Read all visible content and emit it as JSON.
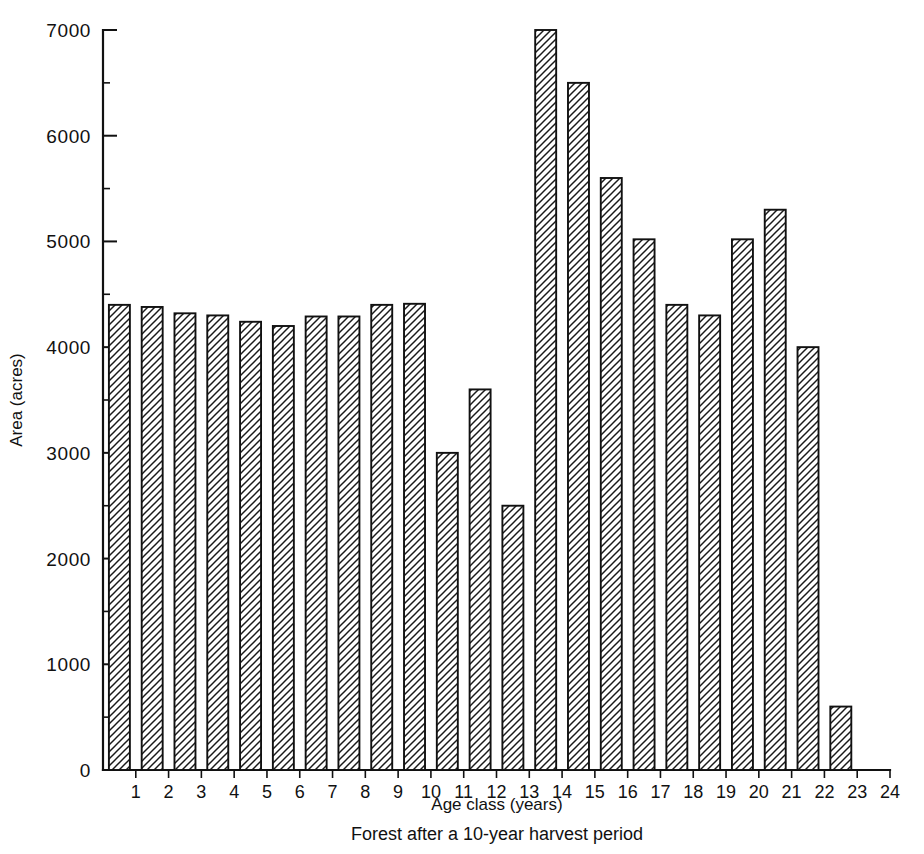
{
  "chart_data": {
    "type": "bar",
    "title": "",
    "subtitle": "",
    "xlabel": "Age class (years)",
    "ylabel": "Area (acres)",
    "caption": "Forest after a 10-year harvest period",
    "categories": [
      "1",
      "2",
      "3",
      "4",
      "5",
      "6",
      "7",
      "8",
      "9",
      "10",
      "11",
      "12",
      "13",
      "14",
      "15",
      "16",
      "17",
      "18",
      "19",
      "20",
      "21",
      "22",
      "23"
    ],
    "values": [
      4400,
      4380,
      4320,
      4300,
      4240,
      4200,
      4290,
      4290,
      4400,
      4410,
      3000,
      3600,
      2500,
      7000,
      6500,
      5600,
      5020,
      4400,
      4300,
      5020,
      5300,
      4000,
      600
    ],
    "ylim": [
      0,
      7000
    ],
    "xlim": [
      0,
      24
    ],
    "ytick_labels": [
      "0",
      "1000",
      "2000",
      "3000",
      "4000",
      "5000",
      "6000",
      "7000"
    ],
    "ytick_values": [
      0,
      1000,
      2000,
      3000,
      4000,
      5000,
      6000,
      7000
    ],
    "yminor_values": [
      500,
      1500,
      2500,
      3500,
      4500,
      5500,
      6500
    ],
    "xtick_labels": [
      "1",
      "2",
      "3",
      "4",
      "5",
      "6",
      "7",
      "8",
      "9",
      "10",
      "11",
      "12",
      "13",
      "14",
      "15",
      "16",
      "17",
      "18",
      "19",
      "20",
      "21",
      "22",
      "23",
      "24"
    ],
    "xtick_values": [
      1,
      2,
      3,
      4,
      5,
      6,
      7,
      8,
      9,
      10,
      11,
      12,
      13,
      14,
      15,
      16,
      17,
      18,
      19,
      20,
      21,
      22,
      23,
      24
    ],
    "grid": false,
    "legend": null,
    "bar_fill": "#ffffff",
    "bar_edge": "#111111",
    "bar_hatch": "diagonal-forward-slash",
    "background": "#ffffff"
  }
}
